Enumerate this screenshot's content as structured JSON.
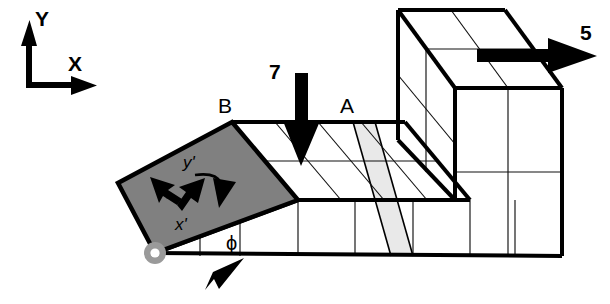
{
  "figure": {
    "background_color": "#ffffff",
    "line_color": "#000000",
    "grid_line_color": "#1a1a1a",
    "panel_fill": "#808080",
    "section_fill": "#e9e9e9",
    "pivot_fill": "#9a9a9a"
  },
  "global_axes": {
    "name": "global-coordinate-triad",
    "x_label": "X",
    "y_label": "Y",
    "origin_x": 52,
    "origin_y": 80
  },
  "local_axes": {
    "name": "local-rotated-axes",
    "x_label": "x'",
    "y_label": "y'",
    "rotation_symbol": "ϕ"
  },
  "points": [
    {
      "label": "B",
      "x": 218,
      "y": 106
    },
    {
      "label": "A",
      "x": 340,
      "y": 106
    }
  ],
  "loads": [
    {
      "label": "7",
      "direction": "down",
      "label_x": 277,
      "label_y": 72,
      "description": "downward point load on top surface"
    },
    {
      "label": "5",
      "direction": "right",
      "label_x": 588,
      "label_y": 32,
      "description": "rightward point load on tall block"
    }
  ],
  "angle": {
    "label": "ϕ",
    "x": 232,
    "y": 248,
    "description": "inclination angle of rotated end face"
  },
  "section": {
    "label": "A",
    "description": "shaded cut plane through slab at A"
  },
  "support": {
    "name": "pin-support",
    "x": 155,
    "y": 253,
    "description": "pinned pivot at lower left corner"
  },
  "geometry": {
    "slab": {
      "top_cells_long": 4,
      "top_cells_deep": 2,
      "front_cells_long": 5,
      "front_cells_high": 1
    },
    "block": {
      "top_cells": "2x2",
      "front_cells": "2x2",
      "side_cells": "2x2"
    }
  }
}
